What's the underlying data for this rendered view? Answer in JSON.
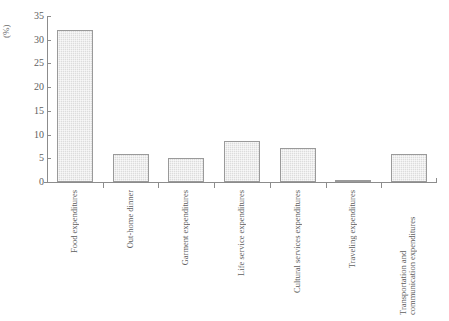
{
  "chart_data": {
    "type": "bar",
    "title": "",
    "xlabel": "",
    "ylabel": "(%)",
    "ylim": [
      0,
      35
    ],
    "yticks": [
      "0",
      "5",
      "10",
      "15",
      "20",
      "25",
      "30",
      "35"
    ],
    "grid": false,
    "legend": "none",
    "categories": [
      "Food expenditures",
      "Out-home dinner",
      "Garment expenditures",
      "Life service expenditures",
      "Cultural services expenditures",
      "Traveling expenditures",
      "Transportation and communication expenditures"
    ],
    "category_lines": [
      [
        "Food expenditures"
      ],
      [
        "Out-home dinner"
      ],
      [
        "Garment expenditures"
      ],
      [
        "Life service expenditures"
      ],
      [
        "Cultural services expenditures"
      ],
      [
        "Traveling expenditures"
      ],
      [
        "Transportation and",
        "communication expenditures"
      ]
    ],
    "values": [
      32.0,
      6.0,
      5.1,
      8.6,
      7.2,
      0.4,
      6.0
    ],
    "bar_face_color": "#dcdcdc",
    "bar_edge_color": "#9a9a9a",
    "axis_color": "#8c8c8c",
    "text_color": "#5e5e5e"
  }
}
